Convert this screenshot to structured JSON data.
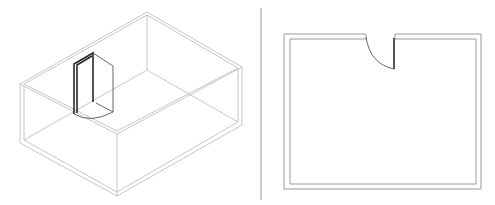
{
  "diagram": {
    "type": "cad-drawing",
    "views": [
      {
        "name": "isometric-view",
        "content": "room box wireframe with open door"
      },
      {
        "name": "plan-view",
        "content": "room floor plan with door swing arc"
      }
    ],
    "colors": {
      "wire": "#b8b8b8",
      "door": "#2a2a2a",
      "wall": "#9a9a9a",
      "separator": "#999999"
    }
  }
}
